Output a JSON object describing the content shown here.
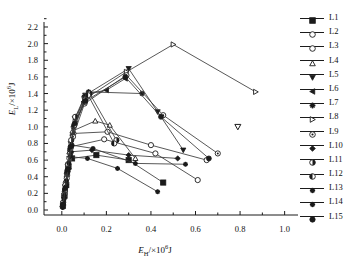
{
  "caption_strip": "",
  "axes": {
    "x": {
      "label_main": "E",
      "label_sub": "H",
      "label_tail": "/×10",
      "label_exp": "6",
      "label_unit": "J",
      "ticks": [
        "0.0",
        "0.2",
        "0.4",
        "0.6",
        "0.8",
        "1.0"
      ],
      "min": -0.08,
      "max": 1.06
    },
    "y": {
      "label_main": "E",
      "label_sub": "L",
      "label_tail": "/×10",
      "label_exp": "6",
      "label_unit": "J",
      "ticks": [
        "0.0",
        "0.2",
        "0.4",
        "0.6",
        "0.8",
        "1.0",
        "1.2",
        "1.4",
        "1.6",
        "1.8",
        "2.0",
        "2.2"
      ],
      "min": -0.06,
      "max": 2.26
    }
  },
  "legend": {
    "position": "right-outside",
    "entries": [
      {
        "label": "L1",
        "marker": "square-filled"
      },
      {
        "label": "L2",
        "marker": "circle-open"
      },
      {
        "label": "L3",
        "marker": "circle-open"
      },
      {
        "label": "L4",
        "marker": "triangle-up-open"
      },
      {
        "label": "L5",
        "marker": "triangle-down-filled"
      },
      {
        "label": "L6",
        "marker": "triangle-left-filled"
      },
      {
        "label": "L7",
        "marker": "star-filled"
      },
      {
        "label": "L8",
        "marker": "triangle-right-open"
      },
      {
        "label": "L9",
        "marker": "circle-dot"
      },
      {
        "label": "L10",
        "marker": "diamond-filled"
      },
      {
        "label": "L11",
        "marker": "circle-half"
      },
      {
        "label": "L12",
        "marker": "circle-halfleft"
      },
      {
        "label": "L13",
        "marker": "star-small"
      },
      {
        "label": "L14",
        "marker": "star-small"
      },
      {
        "label": "L15",
        "marker": "hexagon-filled"
      }
    ]
  },
  "chart_data": {
    "type": "line",
    "title": "",
    "xlabel": "E_H /×10^6 J",
    "ylabel": "E_L /×10^6 J",
    "xlim": [
      -0.08,
      1.06
    ],
    "ylim": [
      -0.06,
      2.26
    ],
    "grid": false,
    "marker_color": "#1b1b1b",
    "line_color": "#3a3a3a",
    "series": [
      {
        "name": "L1",
        "marker": "square-filled",
        "points": [
          [
            0.005,
            0.05
          ],
          [
            0.012,
            0.17
          ],
          [
            0.02,
            0.3
          ],
          [
            0.03,
            0.52
          ],
          [
            0.046,
            0.62
          ],
          [
            0.155,
            0.66
          ],
          [
            0.3,
            0.6
          ],
          [
            0.455,
            0.33
          ]
        ]
      },
      {
        "name": "L2",
        "marker": "circle-open",
        "points": [
          [
            0.004,
            0.04
          ],
          [
            0.01,
            0.16
          ],
          [
            0.018,
            0.33
          ],
          [
            0.028,
            0.55
          ],
          [
            0.04,
            0.76
          ],
          [
            0.19,
            0.85
          ],
          [
            0.42,
            0.68
          ],
          [
            0.61,
            0.36
          ]
        ]
      },
      {
        "name": "L3",
        "marker": "circle-open",
        "points": [
          [
            0.006,
            0.06
          ],
          [
            0.014,
            0.22
          ],
          [
            0.024,
            0.42
          ],
          [
            0.038,
            0.68
          ],
          [
            0.052,
            0.92
          ],
          [
            0.205,
            0.94
          ],
          [
            0.4,
            0.78
          ],
          [
            0.65,
            0.6
          ]
        ]
      },
      {
        "name": "L4",
        "marker": "triangle-up-open",
        "points": [
          [
            0.005,
            0.07
          ],
          [
            0.013,
            0.25
          ],
          [
            0.022,
            0.46
          ],
          [
            0.034,
            0.7
          ],
          [
            0.048,
            0.95
          ],
          [
            0.15,
            1.07
          ],
          [
            0.215,
            1.02
          ],
          [
            0.33,
            0.62
          ]
        ]
      },
      {
        "name": "L5",
        "marker": "triangle-down-filled",
        "points": [
          [
            0.006,
            0.08
          ],
          [
            0.015,
            0.28
          ],
          [
            0.026,
            0.52
          ],
          [
            0.04,
            0.8
          ],
          [
            0.058,
            1.1
          ],
          [
            0.105,
            1.38
          ],
          [
            0.3,
            1.7
          ],
          [
            0.43,
            1.18
          ],
          [
            0.545,
            0.72
          ]
        ]
      },
      {
        "name": "L6",
        "marker": "triangle-left-filled",
        "points": [
          [
            0.004,
            0.05
          ],
          [
            0.012,
            0.2
          ],
          [
            0.021,
            0.4
          ],
          [
            0.033,
            0.64
          ],
          [
            0.047,
            0.9
          ],
          [
            0.098,
            1.3
          ],
          [
            0.118,
            1.4
          ],
          [
            0.2,
            1.44
          ],
          [
            0.285,
            1.58
          ]
        ]
      },
      {
        "name": "L7",
        "marker": "star-filled",
        "points": [
          [
            0.005,
            0.06
          ],
          [
            0.013,
            0.23
          ],
          [
            0.023,
            0.45
          ],
          [
            0.036,
            0.72
          ],
          [
            0.052,
            1.0
          ],
          [
            0.1,
            1.36
          ],
          [
            0.12,
            1.42
          ],
          [
            0.36,
            1.4
          ]
        ]
      },
      {
        "name": "L8",
        "marker": "triangle-right-open",
        "points": [
          [
            0.006,
            0.07
          ],
          [
            0.016,
            0.27
          ],
          [
            0.028,
            0.5
          ],
          [
            0.042,
            0.78
          ],
          [
            0.06,
            1.06
          ],
          [
            0.108,
            1.34
          ],
          [
            0.29,
            1.66
          ],
          [
            0.5,
            1.99
          ],
          [
            0.87,
            1.42
          ]
        ]
      },
      {
        "name": "L9",
        "marker": "circle-dot",
        "points": [
          [
            0.005,
            0.05
          ],
          [
            0.012,
            0.19
          ],
          [
            0.022,
            0.38
          ],
          [
            0.034,
            0.62
          ],
          [
            0.05,
            0.88
          ],
          [
            0.102,
            1.28
          ],
          [
            0.29,
            1.62
          ],
          [
            0.455,
            1.14
          ],
          [
            0.7,
            0.68
          ]
        ]
      },
      {
        "name": "L10",
        "marker": "diamond-filled",
        "points": [
          [
            0.004,
            0.04
          ],
          [
            0.011,
            0.15
          ],
          [
            0.019,
            0.31
          ],
          [
            0.03,
            0.5
          ],
          [
            0.043,
            0.7
          ],
          [
            0.135,
            0.72
          ],
          [
            0.3,
            0.66
          ],
          [
            0.52,
            0.62
          ]
        ]
      },
      {
        "name": "L11",
        "marker": "circle-half",
        "points": [
          [
            0.006,
            0.09
          ],
          [
            0.016,
            0.3
          ],
          [
            0.028,
            0.55
          ],
          [
            0.042,
            0.84
          ],
          [
            0.06,
            1.12
          ],
          [
            0.104,
            1.32
          ],
          [
            0.125,
            1.4
          ],
          [
            0.245,
            0.84
          ]
        ]
      },
      {
        "name": "L12",
        "marker": "circle-halfleft",
        "points": [
          [
            0.005,
            0.06
          ],
          [
            0.014,
            0.24
          ],
          [
            0.025,
            0.47
          ],
          [
            0.039,
            0.74
          ],
          [
            0.056,
            1.02
          ],
          [
            0.103,
            1.3
          ],
          [
            0.118,
            1.38
          ],
          [
            0.235,
            0.8
          ]
        ]
      },
      {
        "name": "L13",
        "marker": "star-small",
        "points": [
          [
            0.004,
            0.03
          ],
          [
            0.01,
            0.13
          ],
          [
            0.018,
            0.28
          ],
          [
            0.028,
            0.46
          ],
          [
            0.04,
            0.64
          ],
          [
            0.115,
            0.62
          ],
          [
            0.25,
            0.5
          ],
          [
            0.43,
            0.22
          ]
        ]
      },
      {
        "name": "L14",
        "marker": "star-small",
        "points": [
          [
            0.005,
            0.05
          ],
          [
            0.012,
            0.18
          ],
          [
            0.021,
            0.35
          ],
          [
            0.032,
            0.56
          ],
          [
            0.046,
            0.78
          ],
          [
            0.14,
            0.74
          ],
          [
            0.33,
            0.56
          ],
          [
            0.555,
            0.55
          ]
        ]
      },
      {
        "name": "L15",
        "marker": "hexagon-filled",
        "points": [
          [
            0.006,
            0.07
          ],
          [
            0.015,
            0.26
          ],
          [
            0.027,
            0.49
          ],
          [
            0.041,
            0.76
          ],
          [
            0.058,
            1.04
          ],
          [
            0.106,
            1.31
          ],
          [
            0.285,
            1.6
          ],
          [
            0.445,
            1.12
          ],
          [
            0.66,
            0.62
          ]
        ]
      }
    ],
    "isolated_points": [
      {
        "name": "L5-outlier",
        "marker": "triangle-down-open",
        "point": [
          0.79,
          1.0
        ]
      }
    ]
  }
}
